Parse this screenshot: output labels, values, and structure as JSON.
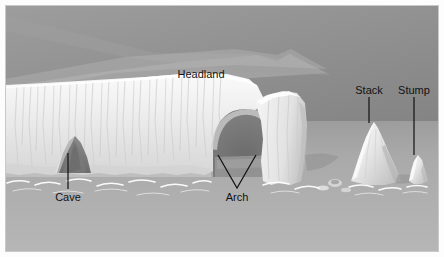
{
  "figure": {
    "type": "labelled-illustration",
    "width": 444,
    "height": 257
  },
  "frame": {
    "margin_color": "#ffffff",
    "border_color": "#c9c9c9",
    "inset_left": 5,
    "inset_top": 5,
    "canvas_width": 434,
    "canvas_height": 247
  },
  "palette": {
    "sky_top": "#9a9a9a",
    "sky_bottom": "#7e7e7e",
    "sea_near": "#b4b4b4",
    "sea_far": "#9b9b9b",
    "cliff_light": "#f2f2f2",
    "cliff_mid": "#dcdcdc",
    "cliff_shade": "#bdbdbd",
    "plateau_top": "#b9b9b9",
    "plateau_shade": "#a3a3a3",
    "cavity_dark": "#6f6f6f",
    "foam_white": "#ffffff",
    "label_text": "#1a1a1a",
    "leader_line": "#111111"
  },
  "labels": [
    {
      "id": "headland",
      "text": "Headland",
      "x": 200,
      "y": 74,
      "anchor": "middle",
      "leader": "none"
    },
    {
      "id": "cave",
      "text": "Cave",
      "x": 68,
      "y": 196,
      "anchor": "middle",
      "leader": "vertical"
    },
    {
      "id": "arch",
      "text": "Arch",
      "x": 237,
      "y": 196,
      "anchor": "middle",
      "leader": "vee"
    },
    {
      "id": "stack",
      "text": "Stack",
      "x": 369,
      "y": 92,
      "anchor": "middle",
      "leader": "vertical"
    },
    {
      "id": "stump",
      "text": "Stump",
      "x": 414,
      "y": 92,
      "anchor": "middle",
      "leader": "vertical"
    }
  ],
  "leader_lines": [
    {
      "id": "cave-leader",
      "from_x": 68,
      "from_y": 189,
      "to_x": 68,
      "to_y": 153
    },
    {
      "id": "arch-leader-left",
      "from_x": 237,
      "from_y": 188,
      "to_x": 218,
      "to_y": 155
    },
    {
      "id": "arch-leader-right",
      "from_x": 237,
      "from_y": 188,
      "to_x": 258,
      "to_y": 155
    },
    {
      "id": "stack-leader",
      "from_x": 369,
      "from_y": 96,
      "to_x": 369,
      "to_y": 118
    },
    {
      "id": "stump-leader",
      "from_x": 414,
      "from_y": 96,
      "to_x": 414,
      "to_y": 150
    }
  ],
  "landforms": [
    {
      "id": "headland-cliff",
      "name": "Headland cliff",
      "description": "Long white chalk cliff running from left edge toward centre-right"
    },
    {
      "id": "cave-opening",
      "name": "Cave",
      "description": "Dark triangular notch at cliff base on the left"
    },
    {
      "id": "arch-opening",
      "name": "Arch",
      "description": "Dark rounded opening piercing the cliff at centre-right"
    },
    {
      "id": "stack-rock",
      "name": "Stack",
      "description": "Tall isolated conical rock standing in the sea"
    },
    {
      "id": "stump-rock",
      "name": "Stump",
      "description": "Short rounded remnant rock right of the stack"
    }
  ]
}
